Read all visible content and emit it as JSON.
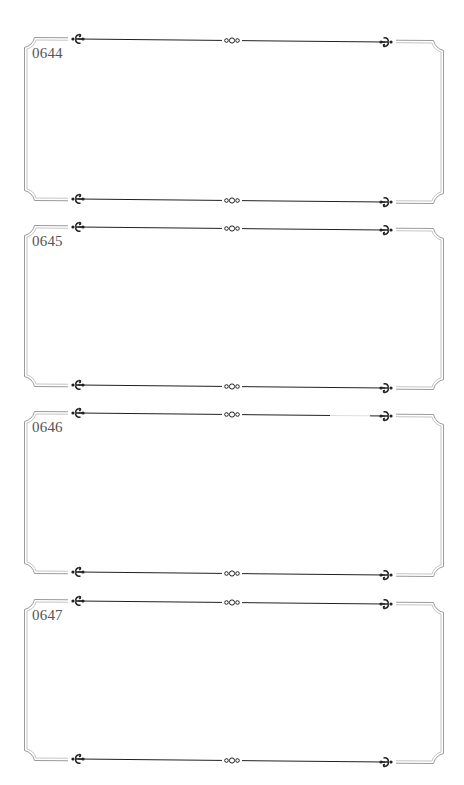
{
  "document": {
    "type": "decorative-label-sheet",
    "colors": {
      "ornament_line": "#222222",
      "border_outer": "#9a9a9a",
      "border_inner": "#c4c4c4",
      "label_text": "#555555",
      "background": "#ffffff"
    },
    "ornaments": {
      "left": "scroll-flourish-left",
      "center": "triple-ring-knot",
      "right": "scroll-flourish-right"
    },
    "frames": [
      {
        "id": "0644",
        "top": 39,
        "bottom": 199
      },
      {
        "id": "0645",
        "top": 227,
        "bottom": 385
      },
      {
        "id": "0646",
        "top": 413,
        "bottom": 572
      },
      {
        "id": "0647",
        "top": 601,
        "bottom": 759
      }
    ]
  }
}
